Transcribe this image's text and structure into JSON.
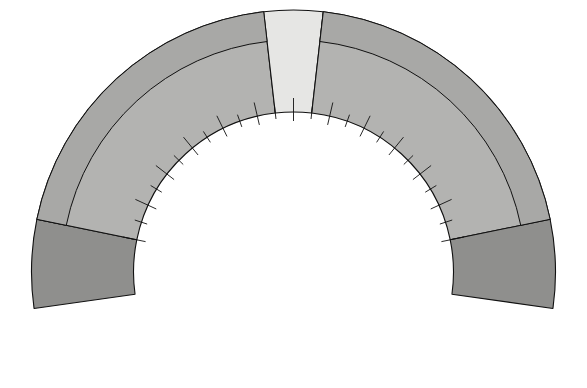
{
  "diagram": {
    "colors": {
      "band_normal": "#e6e6e4",
      "band_mid": "#b3b3b1",
      "band_death": "#8f8f8d",
      "outline": "#111111",
      "sphere": "#8f8f8d",
      "sphere_edge": "#4d4d4d",
      "beam": "#f2f2f0",
      "arrow": "#111111",
      "background": "#ffffff"
    },
    "top_labels": [
      {
        "text": "pH 7.35",
        "name": "ph-735-label"
      },
      {
        "text": "7.45",
        "name": "ph-745-label"
      }
    ],
    "zones": [
      {
        "name": "death-left",
        "label": "DEATH"
      },
      {
        "name": "acidosis",
        "label": "ACIDOSIS"
      },
      {
        "name": "normal",
        "label": "NORMAL"
      },
      {
        "name": "alkalosis",
        "label": "ALKALOSIS"
      },
      {
        "name": "death-right",
        "label": "DEATH"
      }
    ],
    "normal_band": {
      "ratio": "20/1",
      "ph": "7.4",
      "ph_low": "7.35",
      "ph_high": "7.45"
    },
    "boundary_ratios": [
      {
        "text": "Ratio-5/1",
        "side": "left"
      },
      {
        "text": "70/1-Ratio",
        "side": "right"
      }
    ],
    "ratio_labels": [
      {
        "text": "6.3/1",
        "side": "acidosis"
      },
      {
        "text": "8/1",
        "side": "acidosis"
      },
      {
        "text": "10/1",
        "side": "acidosis"
      },
      {
        "text": "12.5/1",
        "side": "acidosis"
      },
      {
        "text": "16/1",
        "side": "acidosis"
      },
      {
        "text": "20/1",
        "side": "normal"
      },
      {
        "text": "25/1",
        "side": "alkalosis"
      },
      {
        "text": "32/1",
        "side": "alkalosis"
      },
      {
        "text": "40/1",
        "side": "alkalosis"
      },
      {
        "text": "50/1",
        "side": "alkalosis"
      },
      {
        "text": "60/1",
        "side": "alkalosis"
      }
    ],
    "ph_labels": [
      {
        "text": "6.8",
        "side": "acidosis"
      },
      {
        "text": "6.9",
        "side": "acidosis"
      },
      {
        "text": "7.0",
        "side": "acidosis"
      },
      {
        "text": "7.1",
        "side": "acidosis"
      },
      {
        "text": "7.2",
        "side": "acidosis"
      },
      {
        "text": "7.3",
        "side": "acidosis"
      },
      {
        "text": "7.4",
        "side": "normal"
      },
      {
        "text": "7.5",
        "side": "alkalosis"
      },
      {
        "text": "7.6",
        "side": "alkalosis"
      },
      {
        "text": "7.7",
        "side": "alkalosis"
      },
      {
        "text": "7.8",
        "side": "alkalosis"
      },
      {
        "text": "7.9",
        "side": "alkalosis"
      },
      {
        "text": "8.0",
        "side": "alkalosis"
      }
    ],
    "pointer": {
      "name": "needle-arrow",
      "points_to": "7.4"
    },
    "balance": {
      "left_pan": {
        "formula": "H–HCO",
        "subscript": "3",
        "amount": "(1 part)",
        "sphere_count": 1
      },
      "right_pan": {
        "formula": "HCO",
        "subscript": "3",
        "amount": "(20 parts)",
        "sphere_count": 20,
        "pyramid_rows": [
          6,
          5,
          4,
          3,
          2
        ]
      }
    }
  },
  "chart_data": {
    "type": "gauge",
    "xlabel": "pH",
    "ylabel": "bicarbonate to carbonic acid ratio",
    "axis_range_ph": [
      6.8,
      8.0
    ],
    "normal_range_ph": [
      7.35,
      7.45
    ],
    "pointer_value_ph": 7.4,
    "pointer_value_ratio": "20/1",
    "ticks": [
      {
        "ph": 6.8,
        "ratio": "5/1",
        "zone": "death-left"
      },
      {
        "ph": 6.9,
        "ratio": "6.3/1",
        "zone": "acidosis"
      },
      {
        "ph": 7.0,
        "ratio": "8/1",
        "zone": "acidosis"
      },
      {
        "ph": 7.1,
        "ratio": "10/1",
        "zone": "acidosis"
      },
      {
        "ph": 7.2,
        "ratio": "12.5/1",
        "zone": "acidosis"
      },
      {
        "ph": 7.3,
        "ratio": "16/1",
        "zone": "acidosis"
      },
      {
        "ph": 7.4,
        "ratio": "20/1",
        "zone": "normal"
      },
      {
        "ph": 7.5,
        "ratio": "25/1",
        "zone": "alkalosis"
      },
      {
        "ph": 7.6,
        "ratio": "32/1",
        "zone": "alkalosis"
      },
      {
        "ph": 7.7,
        "ratio": "40/1",
        "zone": "alkalosis"
      },
      {
        "ph": 7.8,
        "ratio": "50/1",
        "zone": "alkalosis"
      },
      {
        "ph": 7.9,
        "ratio": "60/1",
        "zone": "alkalosis"
      },
      {
        "ph": 8.0,
        "ratio": "70/1",
        "zone": "death-right"
      }
    ],
    "zones": [
      {
        "label": "DEATH",
        "ph_from": 6.65,
        "ph_to": 6.8
      },
      {
        "label": "ACIDOSIS",
        "ph_from": 6.8,
        "ph_to": 7.35
      },
      {
        "label": "NORMAL",
        "ph_from": 7.35,
        "ph_to": 7.45
      },
      {
        "label": "ALKALOSIS",
        "ph_from": 7.45,
        "ph_to": 8.0
      },
      {
        "label": "DEATH",
        "ph_from": 8.0,
        "ph_to": 8.15
      }
    ]
  }
}
